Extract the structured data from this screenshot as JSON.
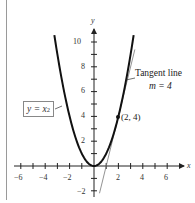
{
  "chart_data": {
    "type": "line",
    "title": "",
    "xlabel": "x",
    "ylabel": "y",
    "xlim": [
      -6.5,
      6.8
    ],
    "ylim": [
      -2.3,
      11
    ],
    "x_ticks": [
      -6,
      -4,
      -2,
      2,
      4,
      6
    ],
    "y_ticks": [
      -2,
      2,
      4,
      6,
      8,
      10
    ],
    "x_tick_labels": [
      "-6",
      "-4",
      "-2",
      "2",
      "4",
      "6"
    ],
    "y_tick_labels": [
      "−2",
      "2",
      "4",
      "6",
      "8",
      "10"
    ],
    "grid": false,
    "series": [
      {
        "name": "y = x^2",
        "kind": "curve",
        "function": "x^2",
        "x_range": [
          -3.25,
          3.25
        ],
        "color": "#111111"
      },
      {
        "name": "Tangent line",
        "kind": "line",
        "function": "4x - 4",
        "slope": 4,
        "x_range": [
          0.45,
          3.35
        ],
        "color": "#777777"
      }
    ],
    "points": [
      {
        "x": 2,
        "y": 4,
        "label": "(2, 4)"
      }
    ],
    "annotations": [
      {
        "text": "Tangent line",
        "subtext": "m = 4"
      },
      {
        "text": "y = x²",
        "boxed": true
      }
    ]
  },
  "labels": {
    "x_axis": "x",
    "y_axis": "y",
    "point": "(2, 4)",
    "tangent_title": "Tangent line",
    "tangent_slope": "m = 4",
    "eq_base": "y = x",
    "eq_exp": "2",
    "x_ticks": [
      "−6",
      "−4",
      "−2",
      "2",
      "4",
      "6"
    ],
    "y_ticks": [
      "10",
      "8",
      "6",
      "4",
      "2",
      "−2"
    ]
  }
}
